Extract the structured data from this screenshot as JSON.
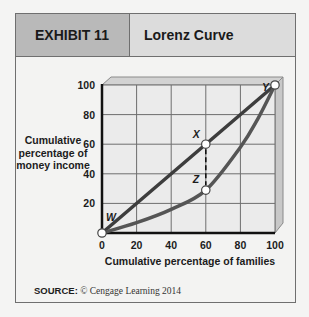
{
  "header": {
    "exhibit": "EXHIBIT 11",
    "title": "Lorenz Curve"
  },
  "source": {
    "label": "SOURCE:",
    "text": "© Cengage Learning 2014"
  },
  "chart_data": {
    "type": "line",
    "title": "Lorenz Curve",
    "xlabel": "Cumulative percentage of families",
    "ylabel": "Cumulative percentage of money income",
    "xlim": [
      0,
      100
    ],
    "ylim": [
      0,
      100
    ],
    "xticks": [
      "0",
      "20",
      "40",
      "60",
      "80",
      "100"
    ],
    "yticks": [
      "20",
      "40",
      "60",
      "80",
      "100"
    ],
    "grid": true,
    "series": [
      {
        "name": "Line of perfect equality",
        "x": [
          0,
          100
        ],
        "y": [
          0,
          100
        ]
      },
      {
        "name": "Lorenz curve",
        "x": [
          0,
          20,
          40,
          60,
          80,
          90,
          100
        ],
        "y": [
          0,
          7,
          16,
          29,
          58,
          77,
          100
        ]
      }
    ],
    "points": [
      {
        "label": "W",
        "x": 0,
        "y": 0
      },
      {
        "label": "X",
        "x": 60,
        "y": 60
      },
      {
        "label": "Y",
        "x": 100,
        "y": 100
      },
      {
        "label": "Z",
        "x": 60,
        "y": 29
      }
    ],
    "annotations": [
      {
        "type": "dashed-vertical",
        "from": "X",
        "to": "Z"
      }
    ]
  }
}
